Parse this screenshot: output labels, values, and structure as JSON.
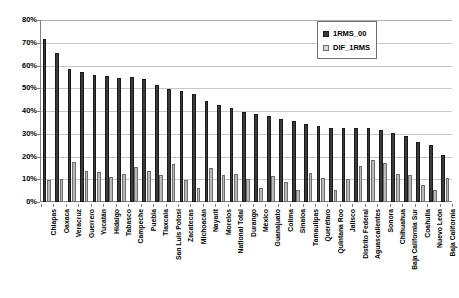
{
  "chart_data": {
    "type": "bar",
    "title": "",
    "xlabel": "",
    "ylabel": "",
    "ylim": [
      0,
      80
    ],
    "yunit": "%",
    "grid": true,
    "legend_position": "top-right",
    "ticks": [
      "0%",
      "10%",
      "20%",
      "30%",
      "40%",
      "50%",
      "60%",
      "70%",
      "80%"
    ],
    "categories": [
      "Chiapas",
      "Oaxaca",
      "Veracruz",
      "Guerrero",
      "Yucatán",
      "Hidalgo",
      "Tabasco",
      "Campeche",
      "Puebla",
      "Tlaxcala",
      "San Luis Potosí",
      "Zacatecas",
      "Michoacán",
      "Nayarit",
      "Morelos",
      "National Total",
      "Durango",
      "México",
      "Guanajuato",
      "Colima",
      "Sinaloa",
      "Tamaulipas",
      "Querétaro",
      "Quintana Roo",
      "Jalisco",
      "Distrito Federal",
      "Aguascalientes",
      "Sonora",
      "Chihuahua",
      "Baja California Sur",
      "Coahuila",
      "Nuevo León",
      "Baja California"
    ],
    "series": [
      {
        "name": "1RMS_00",
        "color": "#3a3a3a",
        "values": [
          71.5,
          65.5,
          58.5,
          57.0,
          55.8,
          55.2,
          54.7,
          54.8,
          54.2,
          51.3,
          49.7,
          48.8,
          47.3,
          44.6,
          42.5,
          41.2,
          39.5,
          38.5,
          37.8,
          36.5,
          35.5,
          34.3,
          33.3,
          32.6,
          32.6,
          32.6,
          32.4,
          31.5,
          30.2,
          28.9,
          26.2,
          25.1,
          20.8
        ]
      },
      {
        "name": "DIF_1RMS",
        "color": "#b9b9b9",
        "values": [
          9.7,
          9.9,
          17.8,
          13.5,
          13.0,
          11.2,
          12.3,
          15.5,
          13.7,
          11.9,
          16.8,
          9.5,
          6.3,
          14.9,
          11.8,
          12.2,
          10.0,
          6.0,
          11.6,
          8.7,
          5.5,
          12.6,
          10.5,
          5.4,
          10.0,
          15.8,
          18.3,
          17.2,
          12.1,
          11.8,
          7.3,
          5.4,
          10.6
        ]
      }
    ]
  },
  "legend": {
    "entries": [
      {
        "label": "1RMS_00"
      },
      {
        "label": "DIF_1RMS"
      }
    ]
  }
}
